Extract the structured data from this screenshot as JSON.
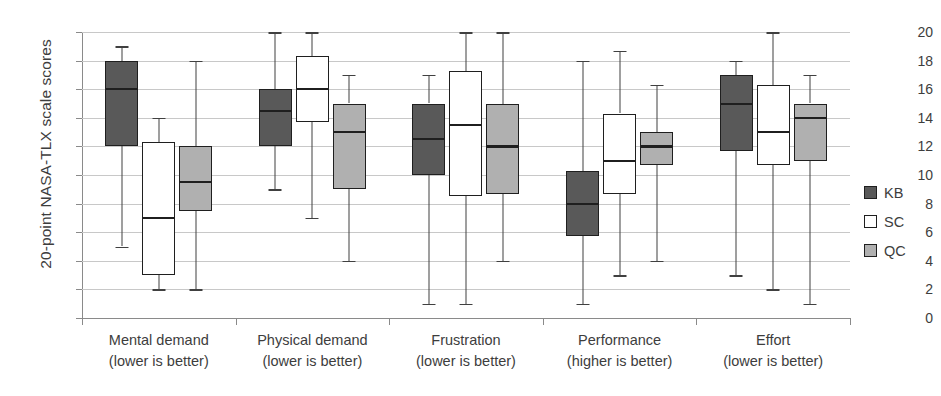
{
  "chart_data": {
    "type": "box",
    "title": "",
    "xlabel": "",
    "ylabel": "20-point NASA-TLX scale scores",
    "ylim": [
      0,
      20
    ],
    "ytick_step": 2,
    "yticks": [
      0,
      2,
      4,
      6,
      8,
      10,
      12,
      14,
      16,
      18,
      20
    ],
    "grid": true,
    "legend_position": "right",
    "categories": [
      "Mental demand",
      "Physical demand",
      "Frustration",
      "Performance",
      "Effort"
    ],
    "category_sublabels": [
      "(lower is better)",
      "(lower is better)",
      "(lower is better)",
      "(higher is better)",
      "(lower is better)"
    ],
    "series": [
      {
        "name": "KB",
        "color": "#595959",
        "boxes": [
          {
            "category": "Mental demand",
            "whisker_low": 5.0,
            "q1": 12.0,
            "median": 16.0,
            "q3": 18.0,
            "whisker_high": 19.0
          },
          {
            "category": "Physical demand",
            "whisker_low": 9.0,
            "q1": 12.0,
            "median": 14.5,
            "q3": 16.0,
            "whisker_high": 20.0
          },
          {
            "category": "Frustration",
            "whisker_low": 1.0,
            "q1": 10.0,
            "median": 12.5,
            "q3": 15.0,
            "whisker_high": 17.0
          },
          {
            "category": "Performance",
            "whisker_low": 1.0,
            "q1": 5.7,
            "median": 8.0,
            "q3": 10.3,
            "whisker_high": 18.0
          },
          {
            "category": "Effort",
            "whisker_low": 3.0,
            "q1": 11.7,
            "median": 15.0,
            "q3": 17.0,
            "whisker_high": 18.0
          }
        ]
      },
      {
        "name": "SC",
        "color": "#ffffff",
        "boxes": [
          {
            "category": "Mental demand",
            "whisker_low": 2.0,
            "q1": 3.0,
            "median": 7.0,
            "q3": 12.3,
            "whisker_high": 14.0
          },
          {
            "category": "Physical demand",
            "whisker_low": 7.0,
            "q1": 13.7,
            "median": 16.0,
            "q3": 18.3,
            "whisker_high": 20.0
          },
          {
            "category": "Frustration",
            "whisker_low": 1.0,
            "q1": 8.5,
            "median": 13.5,
            "q3": 17.3,
            "whisker_high": 20.0
          },
          {
            "category": "Performance",
            "whisker_low": 3.0,
            "q1": 8.7,
            "median": 11.0,
            "q3": 14.3,
            "whisker_high": 18.7
          },
          {
            "category": "Effort",
            "whisker_low": 2.0,
            "q1": 10.7,
            "median": 13.0,
            "q3": 16.3,
            "whisker_high": 20.0
          }
        ]
      },
      {
        "name": "QC",
        "color": "#b0b0b0",
        "boxes": [
          {
            "category": "Mental demand",
            "whisker_low": 2.0,
            "q1": 7.5,
            "median": 9.5,
            "q3": 12.0,
            "whisker_high": 18.0
          },
          {
            "category": "Physical demand",
            "whisker_low": 4.0,
            "q1": 9.0,
            "median": 13.0,
            "q3": 15.0,
            "whisker_high": 17.0
          },
          {
            "category": "Frustration",
            "whisker_low": 4.0,
            "q1": 8.7,
            "median": 12.0,
            "q3": 15.0,
            "whisker_high": 20.0
          },
          {
            "category": "Performance",
            "whisker_low": 4.0,
            "q1": 10.7,
            "median": 12.0,
            "q3": 13.0,
            "whisker_high": 16.3
          },
          {
            "category": "Effort",
            "whisker_low": 1.0,
            "q1": 11.0,
            "median": 14.0,
            "q3": 15.0,
            "whisker_high": 17.0
          }
        ]
      }
    ]
  },
  "legend": {
    "entries": [
      {
        "label": "KB",
        "color": "#595959"
      },
      {
        "label": "SC",
        "color": "#ffffff"
      },
      {
        "label": "QC",
        "color": "#b0b0b0"
      }
    ]
  }
}
